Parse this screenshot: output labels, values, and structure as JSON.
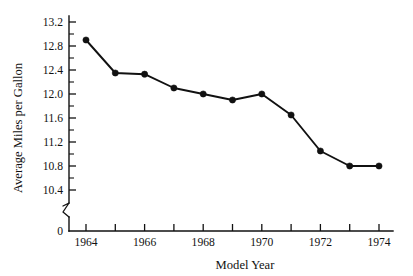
{
  "chart_data": {
    "type": "line",
    "title": "",
    "xlabel": "Model Year",
    "ylabel": "Average Miles per Gallon",
    "x": [
      1964,
      1965,
      1966,
      1967,
      1968,
      1969,
      1970,
      1971,
      1972,
      1973,
      1974
    ],
    "values": [
      12.9,
      12.35,
      12.33,
      12.1,
      12.0,
      11.9,
      12.0,
      11.65,
      11.05,
      10.8,
      10.8
    ],
    "series": [
      {
        "name": "Average Miles per Gallon",
        "values": [
          12.9,
          12.35,
          12.33,
          12.1,
          12.0,
          11.9,
          12.0,
          11.65,
          11.05,
          10.8,
          10.8
        ]
      }
    ],
    "xlim": [
      1963.4,
      1974.6
    ],
    "ylim": [
      10.2,
      13.35
    ],
    "y_axis_break": true,
    "y_break_between": [
      0,
      10.2
    ],
    "y_ticks": [
      10.4,
      10.8,
      11.2,
      11.6,
      12.0,
      12.4,
      12.8,
      13.2
    ],
    "y_tick_labels": [
      "10.4",
      "10.8",
      "11.2",
      "11.6",
      "12.0",
      "12.4",
      "12.8",
      "13.2"
    ],
    "y_minor_ticks": [
      10.6,
      11.0,
      11.4,
      11.8,
      12.2,
      12.6,
      13.0
    ],
    "y_origin_label": "0",
    "x_ticks": [
      1964,
      1965,
      1966,
      1967,
      1968,
      1969,
      1970,
      1971,
      1972,
      1973,
      1974
    ],
    "x_tick_labels_shown": [
      "1964",
      "1966",
      "1968",
      "1970",
      "1972",
      "1974"
    ],
    "x_labeled_ticks": [
      1964,
      1966,
      1968,
      1970,
      1972,
      1974
    ],
    "grid": false,
    "legend": "none",
    "marker": "filled-circle",
    "line_color": "#111111",
    "marker_color": "#111111",
    "background_color": "#ffffff"
  },
  "axes": {
    "y_title": "Average Miles per Gallon",
    "x_title": "Model Year"
  }
}
